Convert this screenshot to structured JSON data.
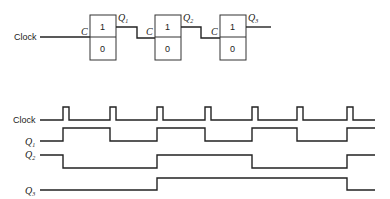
{
  "circuit": {
    "input_label": "Clock",
    "flip_flops": [
      {
        "clock_pin": "C",
        "top": "1",
        "bottom": "0",
        "output": "Q",
        "output_sub": "1"
      },
      {
        "clock_pin": "C",
        "top": "1",
        "bottom": "0",
        "output": "Q",
        "output_sub": "2"
      },
      {
        "clock_pin": "C",
        "top": "1",
        "bottom": "0",
        "output": "Q",
        "output_sub": "3"
      }
    ]
  },
  "timing": {
    "signals": [
      {
        "label": "Clock",
        "sub": ""
      },
      {
        "label": "Q",
        "sub": "1"
      },
      {
        "label": "Q",
        "sub": "2"
      },
      {
        "label": "Q",
        "sub": "3"
      }
    ],
    "clock_pulses": 7
  }
}
